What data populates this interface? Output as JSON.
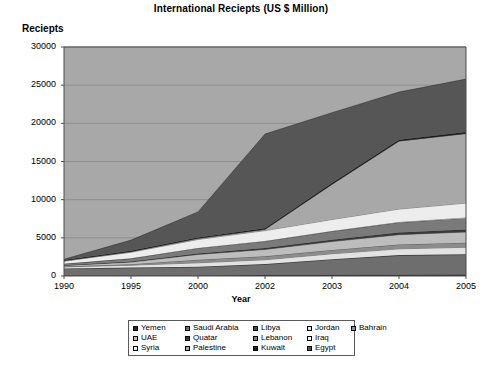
{
  "chart_data": {
    "type": "area",
    "stacked": true,
    "title": "International Reciepts (US $ Million)",
    "xlabel": "Year",
    "ylabel": "Reciepts",
    "categories": [
      "1990",
      "1995",
      "2000",
      "2002",
      "2003",
      "2004",
      "2005"
    ],
    "ylim": [
      0,
      30000
    ],
    "ytick_values": [
      0,
      5000,
      10000,
      15000,
      20000,
      25000,
      30000
    ],
    "ytick_labels": [
      "0",
      "5000",
      "10000",
      "15000",
      "20000",
      "25000",
      "30000"
    ],
    "grid": true,
    "legend_position": "bottom",
    "series": [
      {
        "name": "Yemen",
        "color": "#2b2b2b",
        "values": [
          60,
          70,
          80,
          120,
          160,
          180,
          200
        ]
      },
      {
        "name": "Saudi Arabia",
        "color": "#6e6e6e",
        "values": [
          900,
          1000,
          1100,
          1400,
          2000,
          2500,
          2600
        ]
      },
      {
        "name": "Libya",
        "color": "#4a4a4a",
        "values": [
          30,
          35,
          40,
          45,
          50,
          55,
          60
        ]
      },
      {
        "name": "Jordan",
        "color": "#e2e2e2",
        "values": [
          200,
          310,
          500,
          560,
          700,
          820,
          900
        ]
      },
      {
        "name": "Bahrain",
        "color": "#8c8c8c",
        "values": [
          70,
          130,
          400,
          450,
          500,
          560,
          600
        ]
      },
      {
        "name": "UAE",
        "color": "#bdbdbd",
        "values": [
          100,
          280,
          700,
          900,
          1100,
          1300,
          1400
        ]
      },
      {
        "name": "Quatar",
        "color": "#3a3a3a",
        "values": [
          40,
          60,
          130,
          180,
          240,
          290,
          320
        ]
      },
      {
        "name": "Lebanon",
        "color": "#7a7a7a",
        "values": [
          200,
          400,
          700,
          900,
          1100,
          1300,
          1500
        ]
      },
      {
        "name": "Iraq",
        "color": "#f2f2f2",
        "values": [
          20,
          25,
          30,
          40,
          50,
          60,
          70
        ]
      },
      {
        "name": "Syria",
        "color": "#ededed",
        "values": [
          320,
          800,
          1100,
          1350,
          1500,
          1700,
          1900
        ]
      },
      {
        "name": "Palestine",
        "color": "#a8a8a8",
        "values": [
          60,
          80,
          120,
          150,
          4600,
          8900,
          9100
        ]
      },
      {
        "name": "Kuwait",
        "color": "#1f1f1f",
        "values": [
          90,
          110,
          140,
          160,
          180,
          200,
          220
        ]
      },
      {
        "name": "Egypt",
        "color": "#565656",
        "values": [
          1100,
          2200,
          4300,
          3900,
          4600,
          6300,
          7000
        ]
      }
    ],
    "stack_tops": {
      "1990": [
        60,
        960,
        990,
        1190,
        1260,
        1360,
        1400,
        1600,
        1620,
        1940,
        2000,
        2090,
        2200
      ],
      "1995": [
        70,
        1070,
        1105,
        1415,
        1545,
        1825,
        1885,
        2285,
        2310,
        3110,
        3190,
        3300,
        4700
      ],
      "2000": [
        80,
        1180,
        1220,
        1720,
        2120,
        2820,
        2950,
        3650,
        3680,
        4780,
        4900,
        5040,
        8400
      ],
      "2002": [
        120,
        1520,
        1565,
        2125,
        2575,
        3475,
        3655,
        4555,
        4595,
        5945,
        6095,
        6255,
        18600
      ],
      "2003": [
        160,
        2160,
        2210,
        2910,
        3410,
        4510,
        4750,
        5850,
        5900,
        7400,
        12000,
        12180,
        21400
      ],
      "2004": [
        180,
        2680,
        2735,
        3555,
        4115,
        5415,
        5705,
        7005,
        7065,
        8765,
        17665,
        17865,
        24100
      ],
      "2005": [
        200,
        2800,
        2860,
        3760,
        4360,
        5760,
        6080,
        7580,
        7650,
        9550,
        18650,
        18870,
        25800
      ]
    },
    "top_line_values": [
      2200,
      4700,
      8400,
      18600,
      21400,
      24100,
      25800
    ]
  },
  "legend": {
    "entries": [
      {
        "label": "Yemen"
      },
      {
        "label": "Saudi Arabia"
      },
      {
        "label": "Libya"
      },
      {
        "label": "Jordan"
      },
      {
        "label": "Bahrain"
      },
      {
        "label": "UAE"
      },
      {
        "label": "Quatar"
      },
      {
        "label": "Lebanon"
      },
      {
        "label": "Iraq"
      },
      {
        "label": ""
      },
      {
        "label": "Syria"
      },
      {
        "label": "Palestine"
      },
      {
        "label": "Kuwait"
      },
      {
        "label": "Egypt"
      },
      {
        "label": ""
      }
    ]
  },
  "colors": {
    "plot_background": "#a8a8a8",
    "grid_line": "#8f8f8f",
    "axis_line": "#4d4d4d",
    "page_background": "#ffffff"
  }
}
